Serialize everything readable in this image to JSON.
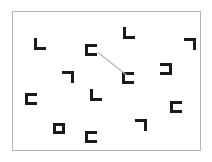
{
  "scene": {
    "title": "visual-search-array",
    "width": 212,
    "height": 162,
    "background_color": "#ffffff"
  },
  "frame": {
    "label": "search-array-border",
    "x": 12,
    "y": 11,
    "width": 189,
    "height": 140,
    "border_color": "#b3b3b3",
    "border_width": 1,
    "fill_color": "#ffffff"
  },
  "style": {
    "item_color": "#1a1a1a",
    "item_stroke_width": 3,
    "item_arm_length": 12,
    "connector_color": "#b0b0b0",
    "connector_width": 1
  },
  "items": [
    {
      "id": "item-1",
      "glyph": "L",
      "orientation": "corner-bottom-left",
      "x": 34,
      "y": 38,
      "w": 12,
      "h": 12
    },
    {
      "id": "item-2",
      "glyph": "L",
      "orientation": "corner-bottom-left",
      "x": 123,
      "y": 27,
      "w": 12,
      "h": 12
    },
    {
      "id": "item-3",
      "glyph": "not-sign",
      "orientation": "corner-top-right",
      "x": 184,
      "y": 38,
      "w": 12,
      "h": 12
    },
    {
      "id": "item-4",
      "glyph": "C",
      "orientation": "bracket-open-right",
      "x": 85,
      "y": 44,
      "w": 12,
      "h": 12
    },
    {
      "id": "item-5",
      "glyph": "C",
      "orientation": "bracket-open-right",
      "x": 122,
      "y": 72,
      "w": 12,
      "h": 12
    },
    {
      "id": "item-6",
      "glyph": "C-mirror",
      "orientation": "bracket-open-left",
      "x": 160,
      "y": 63,
      "w": 12,
      "h": 12
    },
    {
      "id": "item-7",
      "glyph": "not-sign",
      "orientation": "corner-top-right",
      "x": 62,
      "y": 71,
      "w": 12,
      "h": 12
    },
    {
      "id": "item-8",
      "glyph": "L",
      "orientation": "corner-bottom-left",
      "x": 90,
      "y": 89,
      "w": 12,
      "h": 12
    },
    {
      "id": "item-9",
      "glyph": "C",
      "orientation": "bracket-open-right",
      "x": 25,
      "y": 93,
      "w": 12,
      "h": 12
    },
    {
      "id": "item-10",
      "glyph": "C",
      "orientation": "bracket-open-right",
      "x": 170,
      "y": 101,
      "w": 12,
      "h": 12
    },
    {
      "id": "item-11",
      "glyph": "rectangle",
      "orientation": "closed-box",
      "x": 53,
      "y": 123,
      "w": 12,
      "h": 11
    },
    {
      "id": "item-12",
      "glyph": "C",
      "orientation": "bracket-open-right",
      "x": 85,
      "y": 131,
      "w": 12,
      "h": 12
    },
    {
      "id": "item-13",
      "glyph": "not-sign",
      "orientation": "corner-top-right",
      "x": 135,
      "y": 119,
      "w": 12,
      "h": 12
    }
  ],
  "connectors": [
    {
      "id": "connector-1",
      "from": "item-4",
      "to": "item-5",
      "x1": 98,
      "y1": 52,
      "x2": 126,
      "y2": 74
    }
  ]
}
